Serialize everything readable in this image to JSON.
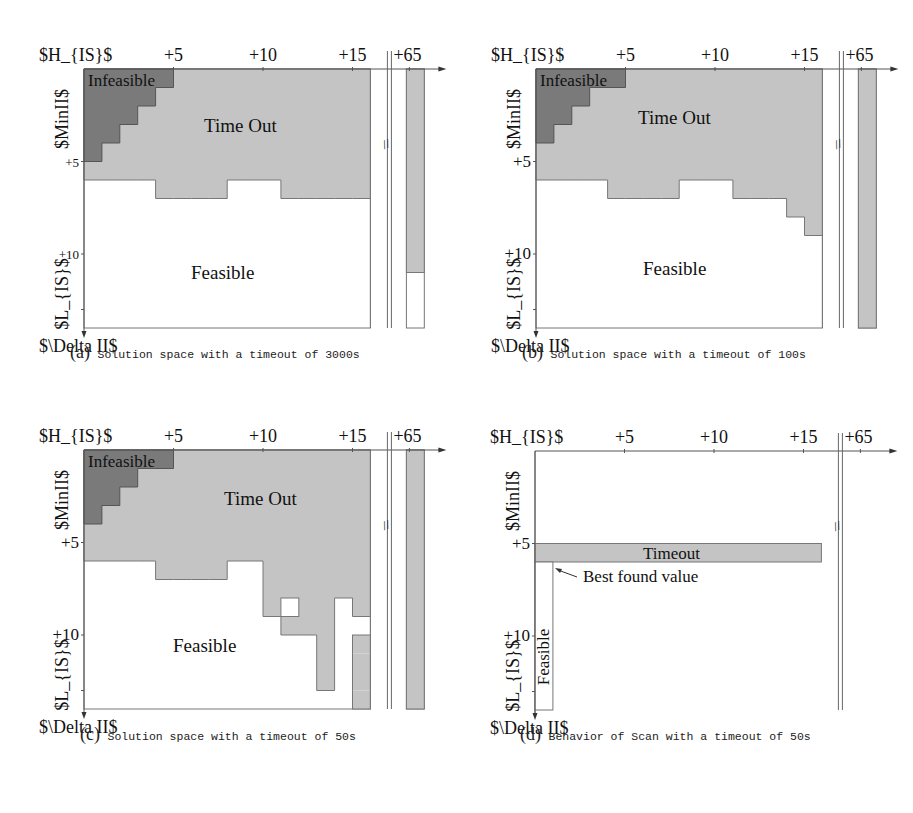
{
  "colors": {
    "timeout": "#c4c4c4",
    "infeasible": "#7a7a7a",
    "feasible": "#ffffff",
    "line": "#777777",
    "text": "#111111"
  },
  "axis_labels": {
    "x_origin": "$H_{IS}$",
    "y_top": "$MinII$",
    "y_bottom": "$L_{IS}$",
    "corner": "$\\Delta II$",
    "x_ticks": [
      "+5",
      "+10",
      "+15"
    ],
    "x_far_tick": "+65",
    "y_ticks": [
      "+5",
      "+10"
    ]
  },
  "chart_data": [
    {
      "type": "heatmap",
      "panel": "a",
      "caption_letter": "(a)",
      "caption": "Solution space with a timeout of 3000s",
      "grid": {
        "cols": 16,
        "rows": 14
      },
      "infeasible_row_extent": [
        5,
        4,
        3,
        2,
        1
      ],
      "timeout_bottom_row_per_col": [
        6,
        6,
        6,
        6,
        7,
        7,
        7,
        7,
        6,
        6,
        6,
        7,
        7,
        7,
        7,
        7
      ],
      "extra_timeout_cells": [],
      "feasible_holes": [],
      "far_column": {
        "label": "+65",
        "timeout_until_row": 11
      },
      "region_labels": {
        "infeasible": "Infeasible",
        "timeout": "Time Out",
        "feasible": "Feasible"
      }
    },
    {
      "type": "heatmap",
      "panel": "b",
      "caption_letter": "(b)",
      "caption": "Solution space with a timeout of 100s",
      "grid": {
        "cols": 16,
        "rows": 14
      },
      "infeasible_row_extent": [
        5,
        3,
        2,
        1
      ],
      "timeout_bottom_row_per_col": [
        6,
        6,
        6,
        6,
        7,
        7,
        7,
        7,
        6,
        6,
        6,
        7,
        7,
        7,
        8,
        9
      ],
      "extra_timeout_cells": [],
      "feasible_holes": [],
      "far_column": {
        "label": "+65",
        "timeout_until_row": 14
      },
      "region_labels": {
        "infeasible": "Infeasible",
        "timeout": "Time Out",
        "feasible": "Feasible"
      }
    },
    {
      "type": "heatmap",
      "panel": "c",
      "caption_letter": "(c)",
      "caption": "Solution space with a timeout of 50s",
      "grid": {
        "cols": 16,
        "rows": 14
      },
      "infeasible_row_extent": [
        5,
        3,
        2,
        1
      ],
      "timeout_bottom_row_per_col": [
        6,
        6,
        6,
        6,
        7,
        7,
        7,
        7,
        6,
        6,
        9,
        10,
        10,
        13,
        8,
        9
      ],
      "extra_timeout_cells": [
        [
          15,
          10
        ],
        [
          15,
          11
        ],
        [
          15,
          12
        ],
        [
          15,
          13
        ]
      ],
      "feasible_holes": [
        [
          11,
          8
        ]
      ],
      "far_column": {
        "label": "+65",
        "timeout_until_row": 14
      },
      "region_labels": {
        "infeasible": "Infeasible",
        "timeout": "Time Out",
        "feasible": "Feasible"
      }
    },
    {
      "type": "heatmap",
      "panel": "d",
      "caption_letter": "(d)",
      "caption": "Behavior of Scan with a timeout of 50s",
      "grid": {
        "cols": 16,
        "rows": 14
      },
      "timeout_bar": {
        "row": 5,
        "from_col": 0,
        "to_col": 16,
        "label": "Timeout"
      },
      "feasible_bar": {
        "col": 0,
        "from_row": 6,
        "to_row": 14,
        "label": "Feasible"
      },
      "annotation": "Best found value",
      "far_column": null
    }
  ]
}
